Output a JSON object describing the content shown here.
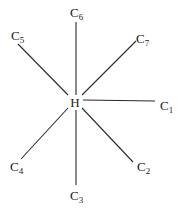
{
  "diagram": {
    "title": "",
    "center": {
      "label": "H",
      "x": 75,
      "y": 102
    },
    "nodes": [
      {
        "id": "C1",
        "element": "C",
        "index": "1",
        "x": 160,
        "y": 110,
        "line": [
          83,
          100,
          155,
          101
        ]
      },
      {
        "id": "C2",
        "element": "C",
        "index": "2",
        "x": 137,
        "y": 171,
        "line": [
          82,
          108,
          133,
          162
        ]
      },
      {
        "id": "C3",
        "element": "C",
        "index": "3",
        "x": 70,
        "y": 200,
        "line": [
          76,
          110,
          76,
          185
        ]
      },
      {
        "id": "C4",
        "element": "C",
        "index": "4",
        "x": 10,
        "y": 171,
        "line": [
          68,
          108,
          21,
          159
        ]
      },
      {
        "id": "C5",
        "element": "C",
        "index": "5",
        "x": 11,
        "y": 40,
        "line": [
          18,
          44,
          68,
          95
        ]
      },
      {
        "id": "C6",
        "element": "C",
        "index": "6",
        "x": 70,
        "y": 17,
        "line": [
          76,
          22,
          76,
          95
        ]
      },
      {
        "id": "C7",
        "element": "C",
        "index": "7",
        "x": 136,
        "y": 43,
        "line": [
          136,
          41,
          82,
          95
        ]
      }
    ],
    "colors": {
      "line": "#2a2a2a",
      "text": "#1a1a1a",
      "background": "#ffffff"
    }
  }
}
